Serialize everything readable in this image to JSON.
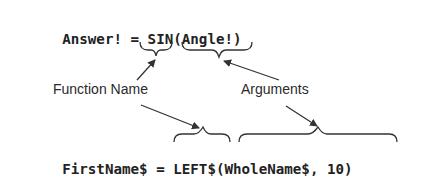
{
  "diagram": {
    "statement_1": {
      "full": "Answer! = SIN(Angle!)",
      "variable": "Answer!",
      "operator": "=",
      "function": "SIN",
      "arguments": "(Angle!)"
    },
    "statement_2": {
      "full": "FirstName$ = LEFT$(WholeName$, 10)",
      "variable": "FirstName$",
      "operator": "=",
      "function": "LEFT$",
      "arguments": "(WholeName$, 10)"
    },
    "labels": {
      "function_name": "Function Name",
      "arguments": "Arguments"
    },
    "colors": {
      "text": "#222222",
      "lines": "#333333",
      "background": "#ffffff"
    }
  }
}
